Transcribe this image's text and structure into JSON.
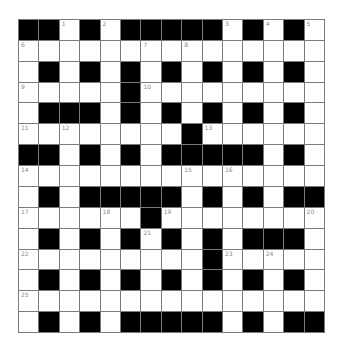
{
  "puzzle": {
    "rows": 15,
    "cols": 15,
    "colors": {
      "block": "#000000",
      "empty": "#ffffff",
      "line": "#7a7a7a",
      "number": "#8a8a8a"
    },
    "grid": [
      "##.#.#####.#.#.",
      "...............",
      ".#.#.#.#.#.#.#.",
      ".....#.........",
      ".###.#.#.#.#.#.",
      "........#......",
      "##.#.#.#####.#.",
      "...............",
      ".#.#####.#.#.##",
      "......#........",
      ".#.#.#.#.#.###.",
      ".........#.....",
      ".#.#.#.#.#.#.#.",
      "...............",
      ".#.#.#####.#.##"
    ],
    "numbers": [
      {
        "row": 0,
        "col": 2,
        "n": "1"
      },
      {
        "row": 0,
        "col": 4,
        "n": "2"
      },
      {
        "row": 0,
        "col": 10,
        "n": "3"
      },
      {
        "row": 0,
        "col": 12,
        "n": "4"
      },
      {
        "row": 0,
        "col": 14,
        "n": "5"
      },
      {
        "row": 1,
        "col": 0,
        "n": "6"
      },
      {
        "row": 1,
        "col": 6,
        "n": "7"
      },
      {
        "row": 1,
        "col": 8,
        "n": "8"
      },
      {
        "row": 3,
        "col": 0,
        "n": "9"
      },
      {
        "row": 3,
        "col": 6,
        "n": "10"
      },
      {
        "row": 5,
        "col": 0,
        "n": "11"
      },
      {
        "row": 5,
        "col": 2,
        "n": "12"
      },
      {
        "row": 5,
        "col": 9,
        "n": "13"
      },
      {
        "row": 7,
        "col": 0,
        "n": "14"
      },
      {
        "row": 7,
        "col": 8,
        "n": "15"
      },
      {
        "row": 7,
        "col": 10,
        "n": "16"
      },
      {
        "row": 9,
        "col": 0,
        "n": "17"
      },
      {
        "row": 9,
        "col": 4,
        "n": "18"
      },
      {
        "row": 9,
        "col": 7,
        "n": "19"
      },
      {
        "row": 9,
        "col": 14,
        "n": "20"
      },
      {
        "row": 10,
        "col": 6,
        "n": "21"
      },
      {
        "row": 11,
        "col": 0,
        "n": "22"
      },
      {
        "row": 11,
        "col": 10,
        "n": "23"
      },
      {
        "row": 11,
        "col": 12,
        "n": "24"
      },
      {
        "row": 13,
        "col": 0,
        "n": "25"
      }
    ]
  }
}
